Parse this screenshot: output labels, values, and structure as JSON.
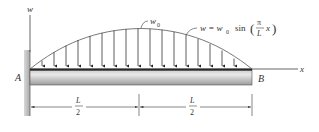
{
  "diagram": {
    "type": "simply supported beam with sinusoidal distributed load",
    "labels": {
      "w_axis": "w",
      "x_axis": "x",
      "end_a": "A",
      "end_b": "B",
      "peak_load": "w",
      "peak_load_sub": "0",
      "load_eq_lhs": "w = w",
      "load_eq_sub": "0",
      "load_eq_func": "sin",
      "load_eq_num": "π",
      "load_eq_den": "L",
      "load_eq_var": "x",
      "dim_left_num": "L",
      "dim_left_den": "2",
      "dim_right_num": "L",
      "dim_right_den": "2"
    },
    "load_arrow_count": 17,
    "colors": {
      "line": "#555555",
      "beam_top": "#2a2a2a",
      "beam_light": "#e6e6e6",
      "beam_dark": "#9a9a9a",
      "wall": "#b5b5b5"
    }
  }
}
